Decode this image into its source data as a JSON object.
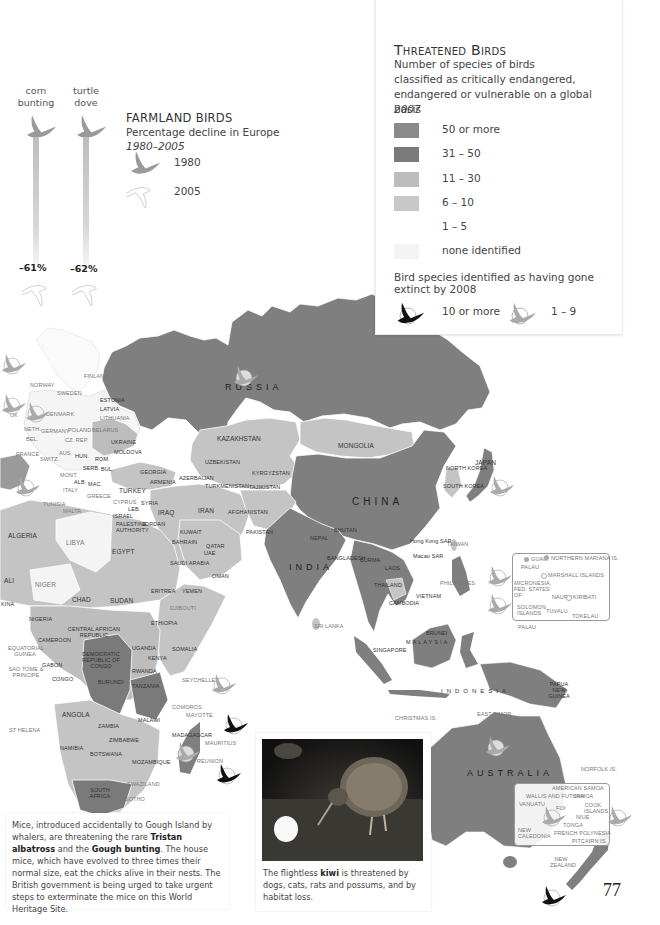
{
  "page": {
    "number": "77"
  },
  "legend": {
    "title": "Threatened Birds",
    "subtitle_lines": [
      "Number of species of birds",
      "classified as critically endangered,",
      "endangered or vulnerable on a global basis"
    ],
    "year": "2007",
    "categories": [
      {
        "label": "50 or more",
        "color": "#8a8a8a"
      },
      {
        "label": "31 – 50",
        "color": "#7a7a7a"
      },
      {
        "label": "11 – 30",
        "color": "#bdbdbd"
      },
      {
        "label": "6 – 10",
        "color": "#c8c8c8"
      },
      {
        "label": "1 – 5",
        "color": "#ffffff"
      },
      {
        "label": "none identified",
        "color": "#f4f4f4"
      }
    ],
    "extinct_title": "Bird species identified as having gone extinct by 2008",
    "extinct": [
      {
        "label": "10 or more",
        "icon": "black-bird-icon"
      },
      {
        "label": "1 – 9",
        "icon": "grey-bird-icon"
      }
    ]
  },
  "farmland": {
    "title": "FARMLAND BIRDS",
    "subtitle": "Percentage decline in Europe",
    "period": "1980–2005",
    "years": [
      "1980",
      "2005"
    ],
    "birds": [
      {
        "name_line1": "corn",
        "name_line2": "bunting",
        "decline": "–61%"
      },
      {
        "name_line1": "turtle",
        "name_line2": "dove",
        "decline": "–62%"
      }
    ]
  },
  "regions": {
    "major": [
      "RUSSIA",
      "CHINA",
      "INDIA",
      "AUSTRALIA",
      "INDONESIA"
    ],
    "europe": [
      "NORWAY",
      "SWEDEN",
      "FINLAND",
      "ESTONIA",
      "LATVIA",
      "LITHUANIA",
      "DENMARK",
      "UK",
      "NETH.",
      "GERMANY",
      "POLAND",
      "BELARUS",
      "BEL.",
      "CZ. REP.",
      "SK",
      "UKRAINE",
      "FRANCE",
      "SWITZ",
      "AUS.",
      "HUN.",
      "ROM.",
      "MOLDOVA",
      "CRO.",
      "BOS.",
      "SERB.",
      "BUL.",
      "MONT.",
      "ALB.",
      "MAC.",
      "ITALY",
      "GREECE",
      "MALTA",
      "CYPRUS",
      "SPAIN",
      "TUNISIA",
      "PORTUGAL"
    ],
    "middle_east_asia": [
      "KAZAKHSTAN",
      "MONGOLIA",
      "UZBEKISTAN",
      "KYRGYZSTAN",
      "TURKMENISTAN",
      "TAJIKISTAN",
      "GEORGIA",
      "ARMENIA",
      "AZERBAIJAN",
      "TURKEY",
      "SYRIA",
      "LEB.",
      "ISRAEL",
      "PALESTINE AUTHORITY",
      "JORDAN",
      "IRAQ",
      "IRAN",
      "KUWAIT",
      "BAHRAIN",
      "QATAR",
      "UAE",
      "SAUDI ARABIA",
      "OMAN",
      "YEMEN",
      "AFGHANISTAN",
      "PAKISTAN",
      "NEPAL",
      "BHUTAN",
      "BANGLADESH",
      "BURMA",
      "LAOS",
      "THAILAND",
      "CAMBODIA",
      "VIETNAM",
      "MALAYSIA",
      "BRUNEI",
      "SINGAPORE",
      "SRI LANKA",
      "PHILIPPINES",
      "TAIWAN",
      "Hong Kong SAR",
      "Macao SAR",
      "NORTH KOREA",
      "SOUTH KOREA",
      "JAPAN",
      "EAST TIMOR",
      "PAPUA NEW GUINEA",
      "CHRISTMAS IS."
    ],
    "africa": [
      "ALGERIA",
      "LIBYA",
      "EGYPT",
      "MALI",
      "NIGER",
      "CHAD",
      "SUDAN",
      "ERITREA",
      "DJIBOUTI",
      "ETHIOPIA",
      "SOMALIA",
      "NIGERIA",
      "CAMEROON",
      "CENTRAL AFRICAN REPUBLIC",
      "EQUATORIAL GUINEA",
      "SAO TOME & PRINCIPE",
      "GABON",
      "CONGO",
      "DEMOCRATIC REPUBLIC OF CONGO",
      "UGANDA",
      "KENYA",
      "RWANDA",
      "BURUNDI",
      "TANZANIA",
      "ANGOLA",
      "ZAMBIA",
      "MALAWI",
      "ZIMBABWE",
      "NAMIBIA",
      "BOTSWANA",
      "MOZAMBIQUE",
      "SOUTH AFRICA",
      "SWAZILAND",
      "LESOTHO",
      "MADAGASCAR",
      "COMOROS",
      "MAYOTTE",
      "SEYCHELLES",
      "MAURITIUS",
      "REUNION",
      "ST HELENA",
      "GHANA",
      "TOGO",
      "BENIN",
      "BURKINA FASO"
    ],
    "pacific_north": [
      "GUAM",
      "NORTHERN MARIANA IS.",
      "PALAU",
      "MARSHALL ISLANDS",
      "MICRONESIA, FED. STATES OF",
      "NAURU",
      "KIRIBATI",
      "SOLOMON ISLANDS",
      "TUVALU",
      "TOKELAU",
      "PALAU"
    ],
    "pacific_south": [
      "AMERICAN SAMOA",
      "WALLIS AND FUTUNA",
      "SAMOA",
      "VANUATU",
      "FIJI",
      "COOK ISLANDS",
      "NIUE",
      "TONGA",
      "NEW CALEDONIA",
      "FRENCH POLYNESIA",
      "PITCAIRN IS.",
      "NORFOLK IS.",
      "NEW ZEALAND"
    ]
  },
  "captions": {
    "mice": {
      "p1": "Mice, introduced accidentally to Gough Island by whalers, are threatening the rare ",
      "b1": "Tristan albatross",
      "p2": " and the ",
      "b2": "Gough bunting",
      "p3": ". The house mice, which have evolved to three times their normal size, eat the chicks alive in their nests. The British government is being urged to take urgent steps to exterminate the mice on this World Heritage Site."
    },
    "kiwi": {
      "p1": "The flightless ",
      "b1": "kiwi",
      "p2": " is threatened by dogs, cats, rats and possums, and by habitat loss."
    }
  },
  "labels": {
    "russia": "RUSSIA",
    "china": "CHINA",
    "india": "INDIA",
    "australia": "AUSTRALIA",
    "indonesia": "INDONESIA",
    "kazakhstan": "KAZAKHSTAN",
    "mongolia": "MONGOLIA",
    "uzbekistan": "UZBEKISTAN",
    "kyrgyzstan": "KYRGYZSTAN",
    "turkmenistan": "TURKMENISTAN",
    "tajikistan": "TAJIKISTAN",
    "georgia": "GEORGIA",
    "armenia": "ARMENIA",
    "azerbaijan": "AZERBAIJAN",
    "turkey": "TURKEY",
    "syria": "SYRIA",
    "iraq": "IRAQ",
    "iran": "IRAN",
    "afghanistan": "AFGHANISTAN",
    "pakistan": "PAKISTAN",
    "jordan": "JORDAN",
    "kuwait": "KUWAIT",
    "bahrain": "BAHRAIN",
    "qatar": "QATAR",
    "uae": "UAE",
    "saudi": "SAUDI ARABIA",
    "oman": "OMAN",
    "yemen": "YEMEN",
    "nepal": "NEPAL",
    "bhutan": "BHUTAN",
    "bangladesh": "BANGLADESH",
    "burma": "BURMA",
    "laos": "LAOS",
    "thailand": "THAILAND",
    "cambodia": "CAMBODIA",
    "vietnam": "VIETNAM",
    "malaysia": "MALAYSIA",
    "brunei": "BRUNEI",
    "singapore": "SINGAPORE",
    "srilanka": "SRI LANKA",
    "philippines": "PHILIPPINES",
    "taiwan": "TAIWAN",
    "hongkong": "Hong Kong SAR",
    "macao": "Macao SAR",
    "nkorea": "NORTH KOREA",
    "skorea": "SOUTH KOREA",
    "japan": "JAPAN",
    "easttimor": "EAST TIMOR",
    "png": "PAPUA NEW GUINEA",
    "christmas": "CHRISTMAS IS.",
    "algeria": "ALGERIA",
    "libya": "LIBYA",
    "egypt": "EGYPT",
    "mali": "ALI",
    "niger": "NIGER",
    "chad": "CHAD",
    "sudan": "SUDAN",
    "eritrea": "ERITREA",
    "djibouti": "DJIBOUTI",
    "ethiopia": "ETHIOPIA",
    "somalia": "SOMALIA",
    "nigeria": "NIGERIA",
    "cameroon": "CAMEROON",
    "car": "CENTRAL AFRICAN REPUBLIC",
    "eqguinea": "EQUATORIAL GUINEA",
    "saotome": "SAO TOME & PRINCIPE",
    "gabon": "GABON",
    "congo": "CONGO",
    "drc": "DEMOCRATIC REPUBLIC OF CONGO",
    "uganda": "UGANDA",
    "kenya": "KENYA",
    "rwanda": "RWANDA",
    "burundi": "BURUNDI",
    "tanzania": "TANZANIA",
    "angola": "ANGOLA",
    "zambia": "ZAMBIA",
    "malawi": "MALAWI",
    "zimbabwe": "ZIMBABWE",
    "namibia": "NAMIBIA",
    "botswana": "BOTSWANA",
    "mozambique": "MOZAMBIQUE",
    "southafrica": "SOUTH AFRICA",
    "swaziland": "SWAZILAND",
    "lesotho": "LESOTHO",
    "madagascar": "MADAGASCAR",
    "comoros": "COMOROS",
    "mayotte": "MAYOTTE",
    "seychelles": "SEYCHELLES",
    "mauritius": "MAURITIUS",
    "reunion": "REUNION",
    "sthelena": "ST HELENA",
    "norway": "NORWAY",
    "sweden": "SWEDEN",
    "finland": "FINLAND",
    "estonia": "ESTONIA",
    "latvia": "LATVIA",
    "lithuania": "LITHUANIA",
    "denmark": "DENMARK",
    "uk": "UK",
    "neth": "NETH.",
    "germany": "GERMANY",
    "poland": "POLAND",
    "belarus": "BELARUS",
    "bel": "BEL.",
    "czrep": "CZ. REP.",
    "ukraine": "UKRAINE",
    "france": "FRANCE",
    "switz": "SWITZ.",
    "aus": "AUS.",
    "hun": "HUN.",
    "rom": "ROM.",
    "moldova": "MOLDOVA",
    "serb": "SERB.",
    "bul": "BUL.",
    "mont": "MONT.",
    "alb": "ALB.",
    "mac": "MAC.",
    "italy": "ITALY",
    "greece": "GREECE",
    "malta": "MALTA",
    "cyprus": "CYPRUS",
    "tunisia": "TUNISIA",
    "leb": "LEB.",
    "israel": "ISRAEL",
    "palestine": "PALESTINE AUTHORITY",
    "ghana": "GHANA",
    "togo": "TOGO",
    "benin": "BENIN",
    "burkina": "KINA",
    "guam": "GUAM",
    "nmariana": "NORTHERN MARIANA IS.",
    "palau": "PALAU",
    "marshall": "MARSHALL ISLANDS",
    "micronesia": "MICRONESIA, FED. STATES OF",
    "nauru": "NAURU",
    "kiribati": "KIRIBATI",
    "solomon": "SOLOMON ISLANDS",
    "tuvalu": "TUVALU",
    "tokelau": "TOKELAU",
    "palau2": "PALAU",
    "amsamoa": "AMERICAN SAMOA",
    "wallis": "WALLIS AND FUTUNA",
    "samoa": "SAMOA",
    "vanuatu": "VANUATU",
    "fiji": "FIJI",
    "cook": "COOK ISLANDS",
    "niue": "NIUE",
    "tonga": "TONGA",
    "newcal": "NEW CALEDONIA",
    "frpoly": "FRENCH POLYNESIA",
    "pitcairn": "PITCAIRN IS.",
    "norfolk": "NORFOLK IS.",
    "nz": "NEW ZEALAND"
  }
}
